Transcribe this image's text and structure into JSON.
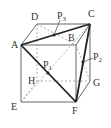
{
  "figure": {
    "type": "cube-diagram",
    "vertices": {
      "A": {
        "label": "A",
        "x": 21,
        "y": 45
      },
      "B": {
        "label": "B",
        "x": 76,
        "y": 45
      },
      "C": {
        "label": "C",
        "x": 90,
        "y": 24
      },
      "D": {
        "label": "D",
        "x": 37,
        "y": 24
      },
      "E": {
        "label": "E",
        "x": 21,
        "y": 102
      },
      "F": {
        "label": "F",
        "x": 76,
        "y": 102
      },
      "G": {
        "label": "G",
        "x": 90,
        "y": 81
      },
      "H": {
        "label": "H",
        "x": 37,
        "y": 81
      }
    },
    "points": {
      "P1": {
        "base": "P",
        "sub": "1",
        "on": "AF"
      },
      "P2": {
        "base": "P",
        "sub": "2",
        "on": "CF"
      },
      "P3": {
        "base": "P",
        "sub": "3",
        "on": "AC"
      }
    },
    "bold_triangle": [
      "A",
      "C",
      "F"
    ],
    "colors": {
      "edge": "#555555",
      "hidden": "#888888",
      "bold": "#222222"
    }
  }
}
